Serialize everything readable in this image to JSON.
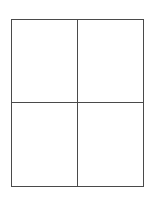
{
  "page": {
    "background_color": "#ffffff",
    "width": 152,
    "height": 202
  },
  "grid": {
    "name": "two-by-two-grid",
    "rows": 2,
    "columns": 2,
    "border_color": "#4a4a4a",
    "border_width_px": 1.5,
    "fill_color": "#ffffff",
    "frame": {
      "left": 11,
      "top": 19,
      "width": 133,
      "height": 168
    },
    "dividers": {
      "vertical_x": 78,
      "horizontal_y": 106
    },
    "cells": [
      {
        "id": "r0c0",
        "row": 0,
        "column": 0,
        "text": ""
      },
      {
        "id": "r0c1",
        "row": 0,
        "column": 1,
        "text": ""
      },
      {
        "id": "r1c0",
        "row": 1,
        "column": 0,
        "text": ""
      },
      {
        "id": "r1c1",
        "row": 1,
        "column": 1,
        "text": ""
      }
    ]
  }
}
